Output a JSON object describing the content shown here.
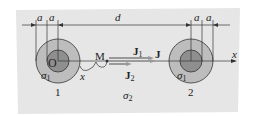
{
  "diagram": {
    "labels": {
      "a1": "a",
      "a2": "a",
      "a3": "a",
      "a4": "a",
      "d": "d",
      "x_axis": "x",
      "x_dist": "x",
      "origin": "O",
      "point_M": "M",
      "J1": "J",
      "J1_sub": "1",
      "J2": "J",
      "J2_sub": "2",
      "J": "J",
      "sigma1_left": "σ",
      "sigma1_left_sub": "1",
      "sigma1_right": "σ",
      "sigma1_right_sub": "1",
      "sigma2": "σ",
      "sigma2_sub": "2",
      "electrode1": "1",
      "electrode2": "2"
    },
    "colors": {
      "background": "#e6e6e6",
      "outer_shell": "#bdbdbd",
      "inner_core": "#8f8f8f",
      "lines": "#333333"
    }
  }
}
